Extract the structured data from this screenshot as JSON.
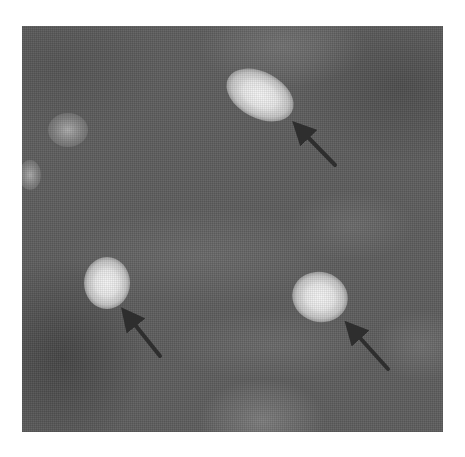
{
  "figure": {
    "kind": "grayscale fluorescence micrograph",
    "background_color": "#5e5e5e",
    "frame": {
      "x": 22,
      "y": 26,
      "width": 421,
      "height": 406
    },
    "arrow_color": "#2e2e2e",
    "cells": [
      {
        "id": "cell-1",
        "label": "bright cell (upper center)",
        "cx": 260,
        "cy": 95,
        "w": 72,
        "h": 46,
        "rotate": 28,
        "type": "bright",
        "marked": true
      },
      {
        "id": "cell-2",
        "label": "bright cell (lower left)",
        "cx": 107,
        "cy": 283,
        "w": 46,
        "h": 52,
        "rotate": 0,
        "type": "bright",
        "marked": true
      },
      {
        "id": "cell-3",
        "label": "bright cell (lower right)",
        "cx": 320,
        "cy": 297,
        "w": 56,
        "h": 50,
        "rotate": 15,
        "type": "bright",
        "marked": true
      },
      {
        "id": "cell-4",
        "label": "faint cell (upper left)",
        "cx": 68,
        "cy": 130,
        "w": 40,
        "h": 34,
        "rotate": 0,
        "type": "faint",
        "marked": false
      },
      {
        "id": "cell-5",
        "label": "faint cell (left edge)",
        "cx": 30,
        "cy": 175,
        "w": 22,
        "h": 30,
        "rotate": 0,
        "type": "faint",
        "marked": false
      }
    ],
    "arrows": [
      {
        "id": "arrow-1",
        "points_to": "cell-1",
        "tail": [
          335,
          165
        ],
        "head": [
          295,
          124
        ]
      },
      {
        "id": "arrow-2",
        "points_to": "cell-2",
        "tail": [
          160,
          356
        ],
        "head": [
          124,
          311
        ]
      },
      {
        "id": "arrow-3",
        "points_to": "cell-3",
        "tail": [
          388,
          369
        ],
        "head": [
          347,
          324
        ]
      }
    ]
  }
}
